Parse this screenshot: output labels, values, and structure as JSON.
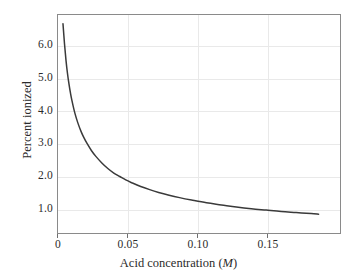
{
  "chart_data": {
    "type": "line",
    "title": "",
    "xlabel": "Acid concentration (M)",
    "xlabel_plain": "Acid concentration (",
    "xlabel_italic": "M",
    "xlabel_tail": ")",
    "ylabel": "Percent ionized",
    "xlim": [
      0.0,
      0.19
    ],
    "ylim": [
      0.55,
      6.9
    ],
    "xticks": [
      0,
      0.05,
      0.1,
      0.15
    ],
    "xtick_labels": [
      "0",
      "0.05",
      "0.10",
      "0.15"
    ],
    "yticks": [
      1.0,
      2.0,
      3.0,
      4.0,
      5.0,
      6.0
    ],
    "ytick_labels": [
      "1.0",
      "2.0",
      "3.0",
      "4.0",
      "5.0",
      "6.0"
    ],
    "grid": true,
    "grid_axis": "both",
    "legend": "none",
    "series": [
      {
        "name": "Percent ionized vs acid concentration",
        "color": "#3a3a3a",
        "line_width": 1.5,
        "x": [
          0.004,
          0.005,
          0.006,
          0.007,
          0.008,
          0.009,
          0.01,
          0.012,
          0.014,
          0.016,
          0.018,
          0.02,
          0.023,
          0.026,
          0.03,
          0.034,
          0.038,
          0.042,
          0.046,
          0.05,
          0.056,
          0.062,
          0.068,
          0.075,
          0.082,
          0.09,
          0.1,
          0.11,
          0.12,
          0.13,
          0.14,
          0.15,
          0.16,
          0.17,
          0.175
        ],
        "y": [
          6.62,
          6.05,
          5.57,
          5.19,
          4.88,
          4.62,
          4.4,
          4.03,
          3.75,
          3.52,
          3.33,
          3.17,
          2.96,
          2.79,
          2.6,
          2.44,
          2.31,
          2.21,
          2.11,
          2.03,
          1.92,
          1.83,
          1.75,
          1.67,
          1.6,
          1.53,
          1.45,
          1.39,
          1.33,
          1.28,
          1.24,
          1.2,
          1.17,
          1.14,
          1.12
        ]
      }
    ],
    "colors": {
      "curve": "#3a3a3a",
      "frame": "#8a8a8a",
      "grid": "#e9e9e9",
      "text": "#2b2b2b",
      "background": "#ffffff"
    }
  }
}
